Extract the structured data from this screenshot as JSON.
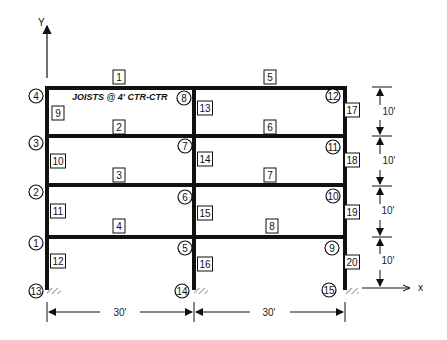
{
  "diagram": {
    "type": "plane-frame",
    "axes": {
      "y_label": "Y",
      "x_label": "x"
    },
    "note": "JOISTS @ 4' CTR-CTR",
    "columns_x": [
      47,
      194,
      345
    ],
    "levels_y": [
      88,
      136,
      185,
      237,
      288
    ],
    "beams": [
      {
        "id": "1",
        "x": 119,
        "y": 77
      },
      {
        "id": "2",
        "x": 119,
        "y": 127
      },
      {
        "id": "3",
        "x": 119,
        "y": 175
      },
      {
        "id": "4",
        "x": 119,
        "y": 226
      },
      {
        "id": "5",
        "x": 270,
        "y": 77
      },
      {
        "id": "6",
        "x": 270,
        "y": 127
      },
      {
        "id": "7",
        "x": 270,
        "y": 175
      },
      {
        "id": "8",
        "x": 272,
        "y": 226
      }
    ],
    "columns": [
      {
        "id": "9",
        "x": 58,
        "y": 113
      },
      {
        "id": "10",
        "x": 58,
        "y": 161
      },
      {
        "id": "11",
        "x": 58,
        "y": 211
      },
      {
        "id": "12",
        "x": 58,
        "y": 261
      },
      {
        "id": "13",
        "x": 205,
        "y": 108
      },
      {
        "id": "14",
        "x": 205,
        "y": 159
      },
      {
        "id": "15",
        "x": 205,
        "y": 213
      },
      {
        "id": "16",
        "x": 205,
        "y": 264
      },
      {
        "id": "17",
        "x": 352,
        "y": 110
      },
      {
        "id": "18",
        "x": 352,
        "y": 160
      },
      {
        "id": "19",
        "x": 352,
        "y": 212
      },
      {
        "id": "20",
        "x": 352,
        "y": 262
      }
    ],
    "nodes": [
      {
        "id": "1",
        "x": 36,
        "y": 243
      },
      {
        "id": "2",
        "x": 36,
        "y": 192
      },
      {
        "id": "3",
        "x": 36,
        "y": 143
      },
      {
        "id": "4",
        "x": 36,
        "y": 96
      },
      {
        "id": "5",
        "x": 185,
        "y": 248
      },
      {
        "id": "6",
        "x": 185,
        "y": 197
      },
      {
        "id": "7",
        "x": 185,
        "y": 146
      },
      {
        "id": "8",
        "x": 184,
        "y": 98
      },
      {
        "id": "9",
        "x": 332,
        "y": 248
      },
      {
        "id": "10",
        "x": 333,
        "y": 196
      },
      {
        "id": "11",
        "x": 333,
        "y": 147
      },
      {
        "id": "12",
        "x": 333,
        "y": 96
      },
      {
        "id": "13",
        "x": 36,
        "y": 291
      },
      {
        "id": "14",
        "x": 182,
        "y": 291
      },
      {
        "id": "15",
        "x": 329,
        "y": 290
      }
    ],
    "dimensions": {
      "horizontal": [
        {
          "label": "30'",
          "x": 120,
          "y": 316
        },
        {
          "label": "30'",
          "x": 269,
          "y": 316
        }
      ],
      "vertical": [
        {
          "label": "10'",
          "x": 389,
          "y": 115
        },
        {
          "label": "10'",
          "x": 389,
          "y": 164
        },
        {
          "label": "10'",
          "x": 388,
          "y": 214
        },
        {
          "label": "10'",
          "x": 388,
          "y": 264
        }
      ]
    }
  }
}
